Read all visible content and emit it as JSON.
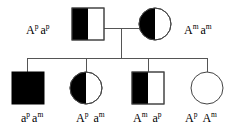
{
  "diagram": {
    "type": "pedigree",
    "generations": 2,
    "colors": {
      "line": "#555555",
      "symbol_stroke": "#444444",
      "affected_fill": "#000000",
      "unaffected_fill": "#ffffff",
      "text": "#000000"
    },
    "generation_1": {
      "name": "parents",
      "individuals": [
        {
          "id": "father",
          "sex": "male",
          "shape": "square",
          "fill_pattern": "left-half-filled",
          "genotype": {
            "allele_1_letter": "A",
            "allele_1_superscript": "p",
            "allele_2_letter": "a",
            "allele_2_superscript": "p"
          }
        },
        {
          "id": "mother",
          "sex": "female",
          "shape": "circle",
          "fill_pattern": "left-half-filled",
          "genotype": {
            "allele_1_letter": "A",
            "allele_1_superscript": "m",
            "allele_2_letter": "a",
            "allele_2_superscript": "m"
          }
        }
      ]
    },
    "generation_2": {
      "name": "children",
      "individuals": [
        {
          "id": "child-1",
          "sex": "male",
          "shape": "square",
          "fill_pattern": "fully-filled",
          "genotype": {
            "allele_1_letter": "a",
            "allele_1_superscript": "p",
            "allele_2_letter": "a",
            "allele_2_superscript": "m"
          }
        },
        {
          "id": "child-2",
          "sex": "female",
          "shape": "circle",
          "fill_pattern": "left-half-filled",
          "genotype": {
            "allele_1_letter": "A",
            "allele_1_superscript": "p",
            "allele_2_letter": "a",
            "allele_2_superscript": "m"
          }
        },
        {
          "id": "child-3",
          "sex": "male",
          "shape": "square",
          "fill_pattern": "left-half-filled",
          "genotype": {
            "allele_1_letter": "A",
            "allele_1_superscript": "m",
            "allele_2_letter": "a",
            "allele_2_superscript": "p"
          }
        },
        {
          "id": "child-4",
          "sex": "female",
          "shape": "circle",
          "fill_pattern": "unfilled",
          "genotype": {
            "allele_1_letter": "A",
            "allele_1_superscript": "p",
            "allele_2_letter": "A",
            "allele_2_superscript": "m"
          }
        }
      ]
    }
  }
}
